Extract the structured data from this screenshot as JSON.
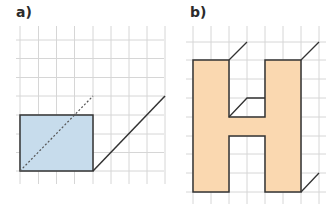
{
  "panels": [
    {
      "label": "a)",
      "grid_color": "#d6d6d6",
      "shape": "rectangle",
      "fill": "#c7dcec",
      "stroke": "#333333",
      "dashed_diagonal": true,
      "extension_line": true
    },
    {
      "label": "b)",
      "grid_color": "#d6d6d6",
      "shape": "letter-H",
      "fill": "#fad8b0",
      "stroke": "#333333",
      "depth_lines": 4
    }
  ]
}
